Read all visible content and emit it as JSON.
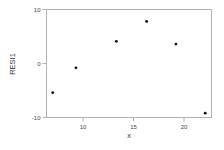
{
  "chart_data": {
    "type": "scatter",
    "title": "",
    "xlabel": "x",
    "ylabel": "RESI1",
    "xlim": [
      6.3,
      22.7
    ],
    "ylim": [
      -10,
      10
    ],
    "xticks": [
      10,
      15,
      20
    ],
    "yticks": [
      -10,
      0,
      10
    ],
    "grid": false,
    "legend": null,
    "series": [
      {
        "name": "RESI1",
        "x": [
          7.0,
          9.3,
          13.3,
          16.3,
          19.2,
          22.1
        ],
        "y": [
          -5.4,
          -0.8,
          4.1,
          7.8,
          3.6,
          -9.2
        ]
      }
    ]
  },
  "axes": {
    "x_title": "x",
    "y_title": "RESI1",
    "x_tick_labels": [
      "10",
      "15",
      "20"
    ],
    "y_tick_labels": [
      "10",
      "0",
      "-10"
    ]
  },
  "colors": {
    "frame": "#b0b0b0",
    "marker": "#111111",
    "text": "#444444"
  }
}
